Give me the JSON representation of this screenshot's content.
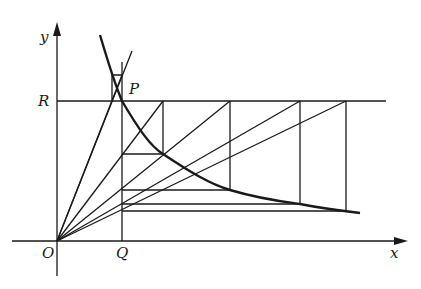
{
  "diagram": {
    "type": "geometric construction",
    "labels": {
      "y_axis": "y",
      "x_axis": "x",
      "origin": "O",
      "point_r": "R",
      "point_p": "P",
      "point_q": "Q"
    },
    "colors": {
      "ink": "#1a1a1a",
      "background": "#ffffff"
    }
  }
}
